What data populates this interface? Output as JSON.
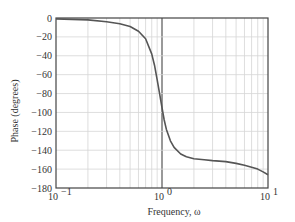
{
  "chart_data": {
    "type": "line",
    "title": "",
    "xlabel": "Frequency, ω",
    "ylabel": "Phase (degrees)",
    "xscale": "log",
    "xlim": [
      0.1,
      10
    ],
    "ylim": [
      -180,
      0
    ],
    "grid": true,
    "legend": null,
    "x_ticks": [
      {
        "value": 0.1,
        "base": "10",
        "exp": "−1"
      },
      {
        "value": 1,
        "base": "10",
        "exp": "0"
      },
      {
        "value": 10,
        "base": "10",
        "exp": "1"
      }
    ],
    "y_ticks": [
      0,
      -20,
      -40,
      -60,
      -80,
      -100,
      -120,
      -140,
      -160,
      -180
    ],
    "y_tick_labels": [
      "0",
      "−20",
      "−40",
      "−60",
      "−80",
      "−100",
      "−120",
      "−140",
      "−160",
      "−180"
    ],
    "series": [
      {
        "name": "phase",
        "x": [
          0.1,
          0.2,
          0.3,
          0.4,
          0.5,
          0.6,
          0.7,
          0.8,
          0.85,
          0.9,
          0.95,
          1.0,
          1.05,
          1.1,
          1.2,
          1.3,
          1.5,
          1.7,
          2.0,
          2.5,
          3,
          4,
          5,
          6,
          7,
          8,
          9,
          10
        ],
        "y": [
          -1,
          -2,
          -4,
          -6,
          -9,
          -14,
          -22,
          -38,
          -50,
          -65,
          -80,
          -95,
          -108,
          -118,
          -130,
          -137,
          -144,
          -147,
          -149,
          -150,
          -151,
          -152,
          -154,
          -156,
          -158,
          -160,
          -163,
          -166
        ]
      }
    ]
  }
}
